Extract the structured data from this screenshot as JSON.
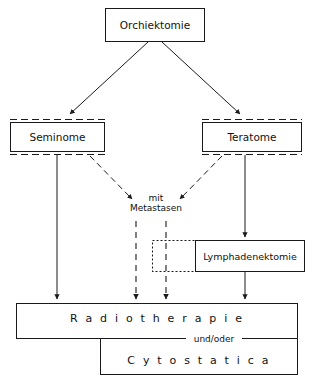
{
  "diagram": {
    "language": "de",
    "background_color": "#ffffff",
    "line_color": "#1a1a1a",
    "text_color": "#111111",
    "nodes": {
      "orchiektomie": {
        "label": "Orchiektomie",
        "border_style": "solid"
      },
      "seminome": {
        "label": "Seminome",
        "border_style": "solid-with-dashed-cap"
      },
      "teratome": {
        "label": "Teratome",
        "border_style": "solid-with-dashed-cap"
      },
      "metastasen": {
        "line1": "mit",
        "line2": "Metastasen",
        "border_style": "none"
      },
      "dotted_box": {
        "label": "",
        "border_style": "dotted"
      },
      "lymphadenektomie": {
        "label": "Lymphadenektomie",
        "border_style": "solid"
      },
      "radiotherapie": {
        "label": "R a d i o t h e r a p i e",
        "border_style": "solid"
      },
      "cytostatica": {
        "label": "C y t o s t a t i c a",
        "border_style": "solid"
      },
      "connector": {
        "label": "und/oder"
      }
    },
    "edges": [
      {
        "from": "orchiektomie",
        "to": "seminome",
        "style": "solid",
        "arrow": true
      },
      {
        "from": "orchiektomie",
        "to": "teratome",
        "style": "solid",
        "arrow": true
      },
      {
        "from": "seminome",
        "to": "radiotherapie",
        "style": "solid",
        "arrow": true
      },
      {
        "from": "seminome",
        "to": "metastasen",
        "style": "dashed",
        "arrow": true
      },
      {
        "from": "teratome",
        "to": "metastasen",
        "style": "dashed",
        "arrow": true
      },
      {
        "from": "teratome",
        "to": "lymphadenektomie",
        "style": "solid",
        "arrow": true
      },
      {
        "from": "metastasen",
        "to": "radiotherapie",
        "style": "dashed",
        "arrow": true
      },
      {
        "from": "metastasen",
        "to": "radiotherapie",
        "style": "dashed",
        "arrow": true
      },
      {
        "from": "lymphadenektomie",
        "to": "radiotherapie",
        "style": "solid",
        "arrow": true
      }
    ]
  }
}
